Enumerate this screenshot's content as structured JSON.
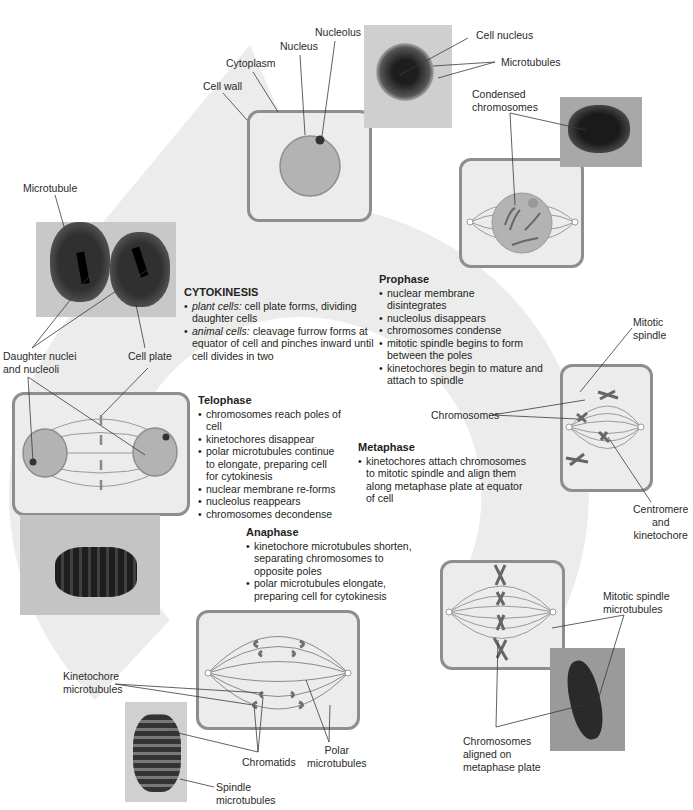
{
  "figure": {
    "colors": {
      "background": "#ffffff",
      "cycle_arrow": "#ebebeb",
      "cell_fill": "#ececec",
      "cell_border": "#8e8e8e",
      "nucleus_fill": "#b3b3b3",
      "chromosome": "#6f6f6f",
      "leader_line": "#3a3a3a"
    }
  },
  "interphase": {
    "labels": {
      "cell_wall": "Cell wall",
      "cytoplasm": "Cytoplasm",
      "nucleus": "Nucleus",
      "nucleolus": "Nucleolus",
      "cell_nucleus": "Cell nucleus",
      "microtubules": "Microtubules"
    }
  },
  "prophase": {
    "labels": {
      "condensed_chromosomes": [
        "Condensed",
        "chromosomes"
      ]
    },
    "title": "Prophase",
    "bullets": [
      "nuclear membrane disintegrates",
      "nucleolus disappears",
      "chromosomes condense",
      "mitotic spindle begins to form between the poles",
      "kinetochores begin to mature and attach to spindle"
    ]
  },
  "metaphase": {
    "labels": {
      "mitotic_spindle": [
        "Mitotic",
        "spindle"
      ],
      "chromosomes": "Chromosomes",
      "centromere_kinetochore": [
        "Centromere",
        "and",
        "kinetochore"
      ],
      "mitotic_spindle_microtubules": [
        "Mitotic spindle",
        "microtubules"
      ],
      "chromosomes_aligned": [
        "Chromosomes",
        "aligned on",
        "metaphase plate"
      ]
    },
    "title": "Metaphase",
    "bullets": [
      "kinetochores attach chromosomes to mitotic spindle and align them along metaphase plate at equator of cell"
    ]
  },
  "anaphase": {
    "labels": {
      "kinetochore_microtubules": [
        "Kinetochore",
        "microtubules"
      ],
      "chromatids": "Chromatids",
      "polar_microtubules": [
        "Polar",
        "microtubules"
      ],
      "spindle_microtubules": [
        "Spindle",
        "microtubules"
      ]
    },
    "title": "Anaphase",
    "bullets": [
      "kinetochore microtubules shorten, separating chromosomes to opposite poles",
      "polar microtubules elongate, preparing cell for cytokinesis"
    ]
  },
  "telophase": {
    "title": "Telophase",
    "bullets": [
      "chromosomes reach poles of cell",
      "kinetochores disappear",
      "polar microtubules continue to elongate, preparing cell for cytokinesis",
      "nuclear membrane re-forms",
      "nucleolus reappears",
      "chromosomes decondense"
    ]
  },
  "cytokinesis": {
    "labels": {
      "microtubule": "Microtubule",
      "daughter_nuclei": [
        "Daughter nuclei",
        "and nucleoli"
      ],
      "cell_plate": "Cell plate"
    },
    "title": "CYTOKINESIS",
    "bullets": [
      {
        "term": "plant cells:",
        "text": " cell plate forms, dividing daughter cells"
      },
      {
        "term": "animal cells:",
        "text": " cleavage furrow forms at equator of cell and pinches inward until cell divides in two"
      }
    ]
  }
}
